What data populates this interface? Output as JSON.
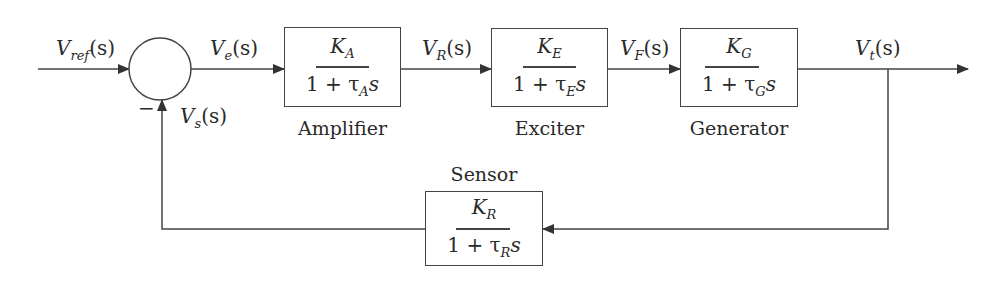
{
  "diagram": {
    "type": "control-system-block-diagram",
    "signals": {
      "v_ref": {
        "base": "V",
        "sub": "ref",
        "arg": "(s)"
      },
      "v_e": {
        "base": "V",
        "sub": "e",
        "arg": "(s)"
      },
      "v_r": {
        "base": "V",
        "sub": "R",
        "arg": "(s)"
      },
      "v_f": {
        "base": "V",
        "sub": "F",
        "arg": "(s)"
      },
      "v_t": {
        "base": "V",
        "sub": "t",
        "arg": "(s)"
      },
      "v_s": {
        "base": "V",
        "sub": "s",
        "arg": "(s)"
      }
    },
    "summing_junction": {
      "minus_sign": "−"
    },
    "blocks": {
      "amplifier": {
        "caption": "Amplifier",
        "num_base": "K",
        "num_sub": "A",
        "den_pre": "1 + τ",
        "den_sub": "A",
        "den_post": "s"
      },
      "exciter": {
        "caption": "Exciter",
        "num_base": "K",
        "num_sub": "E",
        "den_pre": "1 + τ",
        "den_sub": "E",
        "den_post": "s"
      },
      "generator": {
        "caption": "Generator",
        "num_base": "K",
        "num_sub": "G",
        "den_pre": "1 + τ",
        "den_sub": "G",
        "den_post": "s"
      },
      "sensor": {
        "caption": "Sensor",
        "num_base": "K",
        "num_sub": "R",
        "den_pre": "1 + τ",
        "den_sub": "R",
        "den_post": "s"
      }
    },
    "colors": {
      "line": "#444444",
      "text": "#2a2a2a",
      "background": "#ffffff"
    }
  }
}
